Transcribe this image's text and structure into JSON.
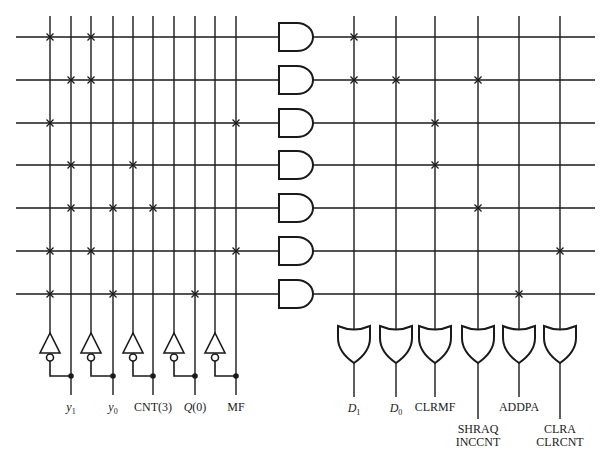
{
  "diagram": {
    "type": "PLA control logic",
    "colors": {
      "line": "#1a1a1a",
      "background": "#ffffff"
    },
    "inputs": [
      {
        "name": "y1",
        "base": "y",
        "sub": "1",
        "italic": true
      },
      {
        "name": "y0",
        "base": "y",
        "sub": "0",
        "italic": true
      },
      {
        "name": "CNT(3)",
        "base": "CNT(3)",
        "sub": "",
        "italic": false
      },
      {
        "name": "Q(0)",
        "base": "Q",
        "sub": "",
        "suffix": "(0)",
        "italic": true
      },
      {
        "name": "MF",
        "base": "MF",
        "sub": "",
        "italic": false
      }
    ],
    "and_plane_columns_x": [
      50,
      71,
      91,
      113,
      133,
      153,
      174,
      195,
      215,
      236
    ],
    "product_rows_y": [
      37,
      80,
      123,
      165,
      208,
      251,
      294
    ],
    "and_plane_connections": [
      [
        0,
        2
      ],
      [
        1,
        2
      ],
      [
        0,
        9
      ],
      [
        1,
        4
      ],
      [
        1,
        3,
        5
      ],
      [
        0,
        2,
        9
      ],
      [
        0,
        3,
        7
      ]
    ],
    "or_plane_columns_x": [
      354,
      396,
      435,
      478,
      519,
      560
    ],
    "or_plane_connections": [
      [
        0
      ],
      [
        0,
        1,
        3
      ],
      [
        2
      ],
      [
        2
      ],
      [
        3
      ],
      [
        5
      ],
      [
        4
      ]
    ],
    "outputs": [
      {
        "lines": [
          "D1"
        ],
        "base": "D",
        "sub": "1",
        "italic": true
      },
      {
        "lines": [
          "D0"
        ],
        "base": "D",
        "sub": "0",
        "italic": true
      },
      {
        "lines": [
          "CLRMF"
        ],
        "italic": false
      },
      {
        "lines": [
          "SHRAQ",
          "INCCNT"
        ],
        "italic": false
      },
      {
        "lines": [
          "ADDPA"
        ],
        "italic": false
      },
      {
        "lines": [
          "CLRA",
          "CLRCNT"
        ],
        "italic": false
      }
    ],
    "labels": {
      "in_0_base": "y",
      "in_0_sub": "1",
      "in_1_base": "y",
      "in_1_sub": "0",
      "in_2": "CNT(3)",
      "in_3_base": "Q",
      "in_3_suffix": "(0)",
      "in_4": "MF",
      "out_0_base": "D",
      "out_0_sub": "1",
      "out_1_base": "D",
      "out_1_sub": "0",
      "out_2": "CLRMF",
      "out_3_line1": "SHRAQ",
      "out_3_line2": "INCCNT",
      "out_4": "ADDPA",
      "out_5_line1": "CLRA",
      "out_5_line2": "CLRCNT"
    }
  }
}
